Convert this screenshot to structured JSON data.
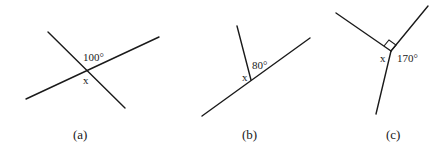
{
  "figures": [
    {
      "id": "a",
      "caption": "(a)",
      "description": "Two straight lines intersecting",
      "angle_label": "100°",
      "unknown_label": "x"
    },
    {
      "id": "b",
      "caption": "(b)",
      "description": "A ray meeting a straight line",
      "angle_label": "80°",
      "unknown_label": "x"
    },
    {
      "id": "c",
      "caption": "(c)",
      "description": "Three rays from a point with one right angle",
      "angle_label": "170°",
      "unknown_label": "x",
      "right_angle_marker": true
    }
  ]
}
